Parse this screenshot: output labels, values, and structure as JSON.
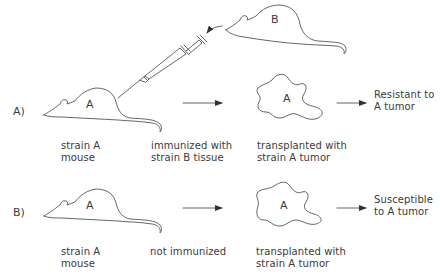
{
  "diagram": {
    "rows": [
      {
        "id": "A",
        "row_label": "A)",
        "mouse_label": "A",
        "tumor_label": "A",
        "donor_mouse_label": "B",
        "captions": {
          "mouse": [
            "strain A",
            "mouse"
          ],
          "treatment": [
            "immunized with",
            "strain B tissue"
          ],
          "transplant": [
            "transplanted with",
            "strain A tumor"
          ]
        },
        "outcome": [
          "Resistant to",
          "A tumor"
        ]
      },
      {
        "id": "B",
        "row_label": "B)",
        "mouse_label": "A",
        "tumor_label": "A",
        "captions": {
          "mouse": [
            "strain A",
            "mouse"
          ],
          "treatment": [
            "not immunized"
          ],
          "transplant": [
            "transplanted with",
            "strain A tumor"
          ]
        },
        "outcome": [
          "Susceptible",
          "to A tumor"
        ]
      }
    ],
    "colors": {
      "line": "#4a4a4a",
      "text": "#3a3a3a",
      "background": "#ffffff"
    }
  }
}
